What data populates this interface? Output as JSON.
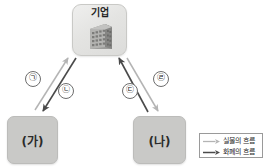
{
  "diagram": {
    "type": "economic-circular-flow",
    "background_color": "#ffffff",
    "nodes": {
      "firm": {
        "label": "기업",
        "icon": "factory-building-icon",
        "fill_color": "#e4e4e2"
      },
      "left": {
        "label": "(가)",
        "fill_color": "#c9c9c7"
      },
      "right": {
        "label": "(나)",
        "fill_color": "#c9c9c7"
      }
    },
    "arrows": [
      {
        "id": "arrow-1",
        "label": "㉠",
        "from": "(가)",
        "to": "기업",
        "direction": "up-right",
        "flow_type": "실물의 흐름",
        "color": "#b4b4b4"
      },
      {
        "id": "arrow-2",
        "label": "㉡",
        "from": "기업",
        "to": "(가)",
        "direction": "down-left",
        "flow_type": "화폐의 흐름",
        "color": "#4a4a4a"
      },
      {
        "id": "arrow-3",
        "label": "㉢",
        "from": "(나)",
        "to": "기업",
        "direction": "up-left",
        "flow_type": "화폐의 흐름",
        "color": "#4a4a4a"
      },
      {
        "id": "arrow-4",
        "label": "㉣",
        "from": "기업",
        "to": "(나)",
        "direction": "down-right",
        "flow_type": "실물의 흐름",
        "color": "#b4b4b4"
      }
    ],
    "legend": {
      "border_color": "#9a9a9a",
      "entries": [
        {
          "label": "실물의 흐름",
          "color": "#b4b4b4",
          "swatch": "light-gray-arrow-icon"
        },
        {
          "label": "화폐의 흐름",
          "color": "#4a4a4a",
          "swatch": "dark-gray-arrow-icon"
        }
      ]
    }
  }
}
